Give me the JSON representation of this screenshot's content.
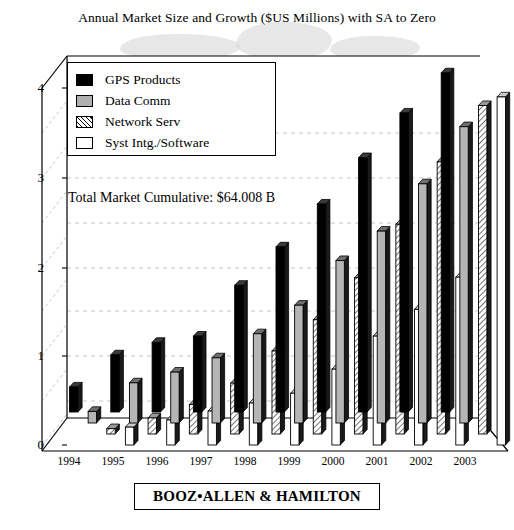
{
  "chart_data": {
    "type": "bar",
    "title": "Annual Market Size and Growth ($US Millions) with SA to Zero",
    "xlabel": "",
    "ylabel": "",
    "ylim": [
      0,
      4
    ],
    "yticks": [
      "0",
      "1",
      "2",
      "3",
      "4"
    ],
    "grid": true,
    "grid_interval": 0.5,
    "legend_position": "top-left-inside",
    "annotation": "Total Market Cumulative: $64.008 B",
    "categories": [
      "1994",
      "1995",
      "1996",
      "1997",
      "1998",
      "1999",
      "2000",
      "2001",
      "2002",
      "2003"
    ],
    "series": [
      {
        "name": "GPS Products",
        "color": "#000000",
        "fill": "solid-black",
        "values": [
          0.28,
          0.64,
          0.78,
          0.85,
          1.42,
          1.85,
          2.33,
          2.85,
          3.35,
          3.8
        ]
      },
      {
        "name": "Data Comm",
        "color": "#b0b0b0",
        "fill": "solid-gray",
        "values": [
          0.13,
          0.45,
          0.57,
          0.73,
          1.0,
          1.32,
          1.82,
          2.15,
          2.68,
          3.32
        ]
      },
      {
        "name": "Network Serv",
        "color": "#ffffff",
        "fill": "diagonal-hatch",
        "values": [
          0.06,
          0.18,
          0.33,
          0.57,
          0.93,
          1.28,
          1.75,
          2.35,
          3.05,
          3.68
        ]
      },
      {
        "name": "Syst Intg./Software",
        "color": "#ffffff",
        "fill": "solid-white",
        "values": [
          0.2,
          0.28,
          0.38,
          0.47,
          0.58,
          0.85,
          1.22,
          1.52,
          1.88,
          3.9
        ]
      }
    ]
  },
  "footer": {
    "company": "BOOZ•ALLEN & HAMILTON"
  }
}
